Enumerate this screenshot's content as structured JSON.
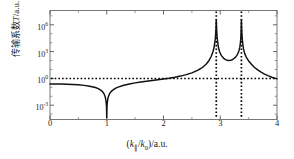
{
  "chart_data": {
    "type": "line",
    "title": "",
    "xlabel": "(k∥/k₀)/a.u.",
    "ylabel": "传输系数T/a.u.",
    "xlabel_parts": {
      "open": "(",
      "k_main": "k",
      "sub1": "∥",
      "slash": "/",
      "k_second": "k",
      "sub2": "0",
      "close": ")/a.u."
    },
    "ylabel_parts": {
      "cn": "传输系数",
      "sym": "T",
      "unit": "/a.u."
    },
    "xlim": [
      0,
      4
    ],
    "ylim_log10": [
      -4.6,
      7.6
    ],
    "xticks": [
      0,
      1,
      2,
      3,
      4
    ],
    "xtick_labels": [
      "0",
      "1",
      "2",
      "3",
      "4"
    ],
    "yticks_log10": [
      6,
      3,
      0,
      -3
    ],
    "ytick_labels": [
      "10",
      "10",
      "10",
      "10"
    ],
    "ytick_exponents": [
      "6",
      "3",
      "0",
      "-3"
    ],
    "grid": false,
    "legend": null,
    "line_color": "#101010",
    "guide_color": "#000000",
    "frame_color": "#6b6b6b",
    "series": [
      {
        "name": "transmission",
        "note": "log10(T) sampled vs k-parallel/k0",
        "x": [
          0.0,
          0.1,
          0.2,
          0.3,
          0.4,
          0.5,
          0.6,
          0.7,
          0.8,
          0.85,
          0.9,
          0.93,
          0.95,
          0.97,
          0.98,
          0.99,
          0.995,
          1.0,
          1.005,
          1.01,
          1.02,
          1.03,
          1.05,
          1.07,
          1.1,
          1.15,
          1.2,
          1.3,
          1.4,
          1.5,
          1.6,
          1.7,
          1.8,
          1.9,
          2.0,
          2.1,
          2.2,
          2.3,
          2.4,
          2.5,
          2.6,
          2.65,
          2.7,
          2.75,
          2.8,
          2.84,
          2.87,
          2.89,
          2.905,
          2.915,
          2.925,
          2.93,
          2.935,
          2.945,
          2.955,
          2.97,
          2.99,
          3.02,
          3.06,
          3.1,
          3.14,
          3.18,
          3.22,
          3.26,
          3.29,
          3.31,
          3.33,
          3.345,
          3.355,
          3.363,
          3.368,
          3.373,
          3.378,
          3.386,
          3.396,
          3.41,
          3.43,
          3.46,
          3.5,
          3.55,
          3.6,
          3.66,
          3.72,
          3.78,
          3.85,
          3.92,
          4.0
        ],
        "log10T": [
          -0.62,
          -0.62,
          -0.63,
          -0.65,
          -0.68,
          -0.72,
          -0.78,
          -0.87,
          -1.02,
          -1.14,
          -1.34,
          -1.52,
          -1.7,
          -2.02,
          -2.28,
          -2.72,
          -3.12,
          -4.4,
          -3.12,
          -2.72,
          -2.28,
          -2.02,
          -1.7,
          -1.52,
          -1.34,
          -1.12,
          -0.97,
          -0.76,
          -0.62,
          -0.5,
          -0.4,
          -0.31,
          -0.23,
          -0.15,
          -0.07,
          0.02,
          0.13,
          0.26,
          0.42,
          0.62,
          0.9,
          1.08,
          1.3,
          1.58,
          1.98,
          2.45,
          2.95,
          3.45,
          4.05,
          4.6,
          5.6,
          6.6,
          5.6,
          4.6,
          4.05,
          3.4,
          2.95,
          2.55,
          2.25,
          2.08,
          2.0,
          2.02,
          2.12,
          2.32,
          2.55,
          2.78,
          3.1,
          3.5,
          4.0,
          4.6,
          5.4,
          6.6,
          5.4,
          4.6,
          3.9,
          3.3,
          2.8,
          2.35,
          1.95,
          1.58,
          1.25,
          0.95,
          0.7,
          0.48,
          0.28,
          0.1,
          -0.05,
          -0.17
        ]
      }
    ],
    "guides": {
      "horizontal_lines_log10": [
        0
      ],
      "vertical_lines_x": [
        2.93,
        3.373
      ],
      "style": "dotted"
    },
    "annotations": []
  }
}
